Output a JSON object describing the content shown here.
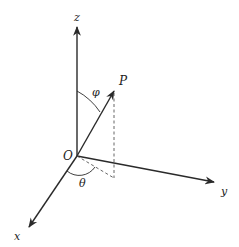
{
  "diagram": {
    "colors": {
      "stroke": "#2a2a2a",
      "dashed": "#555555",
      "background": "#ffffff"
    },
    "labels": {
      "z_axis": "z",
      "y_axis": "y",
      "x_axis": "x",
      "origin": "O",
      "point": "P",
      "polar_angle": "φ",
      "azimuth_angle": "θ"
    },
    "geometry": {
      "origin": [
        77,
        156
      ],
      "z_end": [
        77,
        26
      ],
      "y_end": [
        215,
        182
      ],
      "x_end": [
        28,
        228
      ],
      "p_end": [
        114,
        90
      ],
      "p_projection": [
        114,
        178
      ]
    }
  }
}
